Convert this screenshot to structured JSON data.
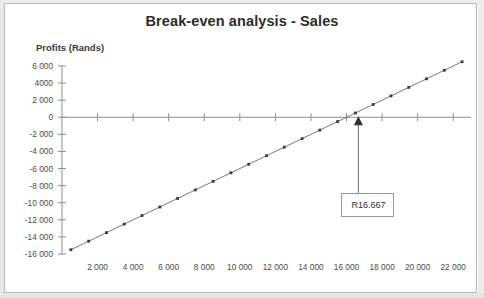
{
  "chart_data": {
    "type": "line",
    "title": "Break-even analysis - Sales",
    "xlabel": "",
    "ylabel": "Profits (Rands)",
    "xlim": [
      0,
      23000
    ],
    "ylim": [
      -16000,
      6000
    ],
    "grid": false,
    "legend": null,
    "x_ticks": [
      2000,
      4000,
      6000,
      8000,
      10000,
      12000,
      14000,
      16000,
      18000,
      20000,
      22000
    ],
    "x_tick_labels": [
      "2 000",
      "4 000",
      "6 000",
      "8 000",
      "10 000",
      "12 000",
      "14 000",
      "16 000",
      "18 000",
      "20 000",
      "22 000"
    ],
    "y_ticks": [
      6000,
      4000,
      2000,
      0,
      -2000,
      -4000,
      -6000,
      -8000,
      -10000,
      -12000,
      -14000,
      -16000
    ],
    "y_tick_labels": [
      "6 000",
      "4000",
      "2 000",
      "0",
      "-2 000",
      "-4 000",
      "-6 000",
      "-8 000",
      "-10 000",
      "-12 000",
      "-14 000",
      "-16 000"
    ],
    "series": [
      {
        "name": "Profit",
        "marker": "square",
        "color": "#6a6a6a",
        "x": [
          500,
          1500,
          2500,
          3500,
          4500,
          5500,
          6500,
          7500,
          8500,
          9500,
          10500,
          11500,
          12500,
          13500,
          14500,
          15500,
          16500,
          17500,
          18500,
          19500,
          20500,
          21500,
          22500
        ],
        "values": [
          -15500,
          -14500,
          -13500,
          -12500,
          -11500,
          -10500,
          -9500,
          -8500,
          -7500,
          -6500,
          -5500,
          -4500,
          -3500,
          -2500,
          -1500,
          -500,
          500,
          1500,
          2500,
          3500,
          4500,
          5500,
          6500
        ]
      }
    ],
    "annotations": [
      {
        "label": "R16.667",
        "type": "callout-box",
        "points_to_x": 16667,
        "points_to_y": 0,
        "description": "break-even point marker"
      }
    ]
  },
  "figure": {
    "title": "Break-even analysis - Sales",
    "axis_title_y": "Profits (Rands)",
    "annotation_label": "R16.667"
  }
}
